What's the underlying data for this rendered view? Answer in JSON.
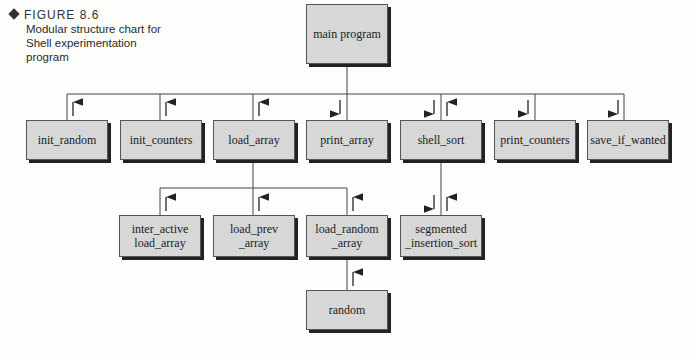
{
  "caption": {
    "figure": "FIGURE 8.6",
    "description": "Modular structure chart for Shell experimentation program"
  },
  "modules": {
    "main": "main program",
    "init_random": "init_random",
    "init_counters": "init_counters",
    "load_array": "load_array",
    "print_array": "print_array",
    "shell_sort": "shell_sort",
    "print_counters": "print_counters",
    "save_if_wanted": "save_if_wanted",
    "inter_active": "inter_active load_array",
    "load_prev": "load_prev _array",
    "load_random": "load_random _array",
    "segmented": "segmented _insertion_sort",
    "random": "random"
  }
}
